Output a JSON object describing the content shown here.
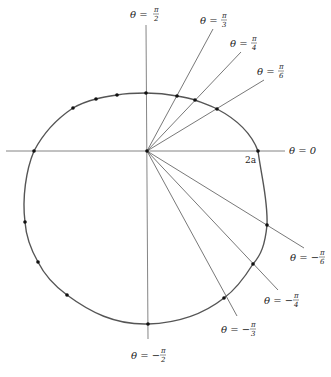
{
  "figure": {
    "type": "polar-curve-plot",
    "origin": {
      "x": 147,
      "y": 151
    },
    "radius_label": "2a",
    "curve_extent": {
      "left_x": 34,
      "right_x": 258,
      "top_y": 93,
      "bottom_y": 324
    },
    "colors": {
      "curve": "#555555",
      "axis": "#777777",
      "ray": "#555555",
      "dot": "#111111",
      "text": "#222222"
    }
  },
  "labels": {
    "theta_0": {
      "lhs": "θ = 0"
    },
    "theta_pi_2": {
      "lhs": "θ =",
      "num": "π",
      "den": "2"
    },
    "theta_pi_3": {
      "lhs": "θ =",
      "num": "π",
      "den": "3"
    },
    "theta_pi_4": {
      "lhs": "θ =",
      "num": "π",
      "den": "4"
    },
    "theta_pi_6": {
      "lhs": "θ =",
      "num": "π",
      "den": "6"
    },
    "theta_neg_pi_6": {
      "lhs": "θ = −",
      "num": "π",
      "den": "6"
    },
    "theta_neg_pi_4": {
      "lhs": "θ = −",
      "num": "π",
      "den": "4"
    },
    "theta_neg_pi_3": {
      "lhs": "θ = −",
      "num": "π",
      "den": "3"
    },
    "theta_neg_pi_2": {
      "lhs": "θ = −",
      "num": "π",
      "den": "2"
    },
    "radius": "2a"
  },
  "rays": [
    {
      "name": "pi_3",
      "x2": 213,
      "y2": 29
    },
    {
      "name": "pi_4",
      "x2": 241,
      "y2": 52
    },
    {
      "name": "pi_6",
      "x2": 264,
      "y2": 80
    },
    {
      "name": "neg_pi_6",
      "x2": 304,
      "y2": 248
    },
    {
      "name": "neg_pi_4",
      "x2": 278,
      "y2": 290
    },
    {
      "name": "neg_pi_3",
      "x2": 237,
      "y2": 316
    }
  ],
  "points": [
    {
      "x": 258,
      "y": 151,
      "theta": "0"
    },
    {
      "x": 217,
      "y": 109,
      "theta": "π/6"
    },
    {
      "x": 195,
      "y": 100,
      "theta": "π/4"
    },
    {
      "x": 177,
      "y": 96,
      "theta": "π/3"
    },
    {
      "x": 146,
      "y": 93,
      "theta": "π/2"
    },
    {
      "x": 117,
      "y": 95
    },
    {
      "x": 96,
      "y": 99
    },
    {
      "x": 73,
      "y": 108
    },
    {
      "x": 34,
      "y": 151,
      "theta": "π"
    },
    {
      "x": 25,
      "y": 222
    },
    {
      "x": 38,
      "y": 262
    },
    {
      "x": 67,
      "y": 295
    },
    {
      "x": 148,
      "y": 324,
      "theta": "−π/2"
    },
    {
      "x": 224,
      "y": 298,
      "theta": "−π/3"
    },
    {
      "x": 253,
      "y": 264,
      "theta": "−π/4"
    },
    {
      "x": 267,
      "y": 225,
      "theta": "−π/6"
    }
  ]
}
